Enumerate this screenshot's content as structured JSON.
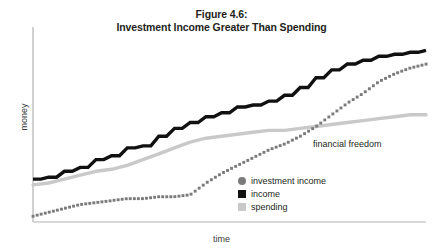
{
  "chart_data": {
    "type": "line",
    "title": "Figure 4.6:",
    "subtitle": "Investment Income Greater Than Spending",
    "xlabel": "time",
    "ylabel": "money",
    "grid": false,
    "legend_position": "inside-bottom-right",
    "axis_origin_px": {
      "x": 33,
      "y": 222
    },
    "axis_extent_px": {
      "x": 426,
      "y": 27
    },
    "xlim": [
      0,
      100
    ],
    "ylim": [
      0,
      100
    ],
    "annotations": [
      {
        "text": "financial freedom",
        "x": 72,
        "y": 44
      }
    ],
    "colors": {
      "income": "#111111",
      "investment_income": "#7b7b7b",
      "spending": "#c9c9c9",
      "axis": "#b3b3b3",
      "text": "#231f20"
    },
    "series": [
      {
        "name": "investment income",
        "style": "dotted",
        "color": "#7b7b7b",
        "marker": "circle",
        "x": [
          0,
          4,
          8,
          12,
          16,
          20,
          24,
          28,
          32,
          36,
          40,
          44,
          48,
          52,
          56,
          60,
          64,
          68,
          72,
          76,
          80,
          84,
          88,
          92,
          96,
          100
        ],
        "y": [
          3,
          5,
          7,
          9,
          10,
          11,
          12,
          12,
          13,
          13,
          14,
          20,
          25,
          29,
          33,
          37,
          40,
          44,
          49,
          55,
          61,
          66,
          72,
          76,
          79,
          81
        ]
      },
      {
        "name": "income",
        "style": "solid-step",
        "color": "#111111",
        "marker": "square",
        "x": [
          0,
          4,
          8,
          12,
          16,
          20,
          24,
          28,
          32,
          36,
          40,
          44,
          48,
          52,
          56,
          60,
          64,
          68,
          72,
          76,
          80,
          84,
          88,
          92,
          96,
          100
        ],
        "y": [
          22,
          23,
          26,
          28,
          32,
          34,
          38,
          39,
          44,
          48,
          51,
          54,
          56,
          59,
          60,
          62,
          65,
          69,
          74,
          78,
          81,
          83,
          85,
          86,
          87,
          88
        ]
      },
      {
        "name": "spending",
        "style": "solid",
        "color": "#c9c9c9",
        "marker": "square",
        "x": [
          0,
          4,
          8,
          12,
          16,
          20,
          24,
          28,
          32,
          36,
          40,
          44,
          48,
          52,
          56,
          60,
          64,
          68,
          72,
          76,
          80,
          84,
          88,
          92,
          96,
          100
        ],
        "y": [
          19,
          20,
          22,
          24,
          26,
          27,
          29,
          32,
          35,
          38,
          41,
          43,
          44,
          45,
          46,
          47,
          47,
          48,
          49,
          50,
          51,
          52,
          53,
          54,
          55,
          55
        ]
      }
    ],
    "legend": [
      {
        "label": "investment income",
        "marker": "circle",
        "color": "#7b7b7b"
      },
      {
        "label": "income",
        "marker": "square",
        "color": "#111111"
      },
      {
        "label": "spending",
        "marker": "square",
        "color": "#c9c9c9"
      }
    ]
  }
}
